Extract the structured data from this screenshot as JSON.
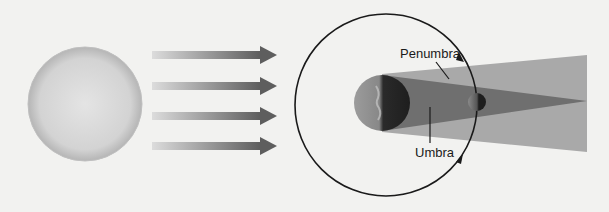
{
  "diagram": {
    "labels": {
      "penumbra": "Penumbra",
      "umbra": "Umbra"
    },
    "elements": {
      "sun": "sun",
      "sunlight_arrows": 4,
      "earth": "earth",
      "moon": "moon",
      "moon_orbit": "orbit"
    },
    "colors": {
      "background": "#f2f2f0",
      "penumbra": "#a9a9a9",
      "umbra": "#6f6f6f",
      "orbit": "#1a1a1a",
      "arrow": "#6a6a6a"
    }
  }
}
